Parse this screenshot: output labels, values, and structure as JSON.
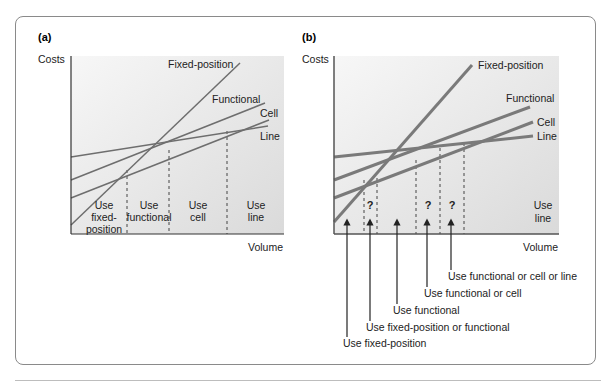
{
  "panels": [
    {
      "id": "a",
      "label": "(a)",
      "y_axis_label": "Costs",
      "x_axis_label": "Volume",
      "series": [
        {
          "name": "Fixed-position",
          "label": "Fixed-position"
        },
        {
          "name": "Functional",
          "label": "Functional"
        },
        {
          "name": "Cell",
          "label": "Cell"
        },
        {
          "name": "Line",
          "label": "Line"
        }
      ],
      "regions": [
        {
          "lines": [
            "Use",
            "fixed-",
            "position"
          ]
        },
        {
          "lines": [
            "Use",
            "functional"
          ]
        },
        {
          "lines": [
            "Use",
            "cell"
          ]
        },
        {
          "lines": [
            "Use",
            "line"
          ]
        }
      ]
    },
    {
      "id": "b",
      "label": "(b)",
      "y_axis_label": "Costs",
      "x_axis_label": "Volume",
      "series": [
        {
          "name": "Fixed-position",
          "label": "Fixed-position"
        },
        {
          "name": "Functional",
          "label": "Functional"
        },
        {
          "name": "Cell",
          "label": "Cell"
        },
        {
          "name": "Line",
          "label": "Line"
        }
      ],
      "uncertain_marks": [
        "?",
        "?",
        "?"
      ],
      "region_label": {
        "lines": [
          "Use",
          "line"
        ]
      },
      "arrow_annotations": [
        "Use fixed-position",
        "Use fixed-position or functional",
        "Use functional",
        "Use functional or cell",
        "Use functional or cell or line"
      ]
    }
  ],
  "colors": {
    "line_stroke": "#707070",
    "plot_bg_light": "#f4f4f4",
    "plot_bg_dark": "#dcdcdc",
    "frame": "#8a8a8a",
    "text": "#222222"
  }
}
